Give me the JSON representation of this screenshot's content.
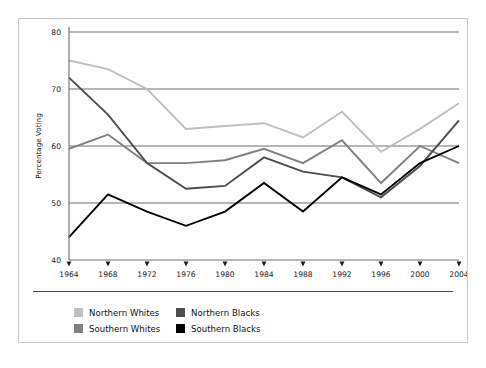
{
  "chart_data": {
    "type": "line",
    "title": "",
    "xlabel": "",
    "ylabel": "Percentage Voting",
    "x": [
      1964,
      1968,
      1972,
      1976,
      1980,
      1984,
      1988,
      1992,
      1996,
      2000,
      2004
    ],
    "xtick_labels": [
      "1964",
      "1968",
      "1972",
      "1976",
      "1980",
      "1984",
      "1988",
      "1992",
      "1996",
      "2000",
      "2004"
    ],
    "ytick_labels": [
      "40",
      "50",
      "60",
      "70",
      "80"
    ],
    "yticks": [
      40,
      50,
      60,
      70,
      80
    ],
    "ylim": [
      40,
      80
    ],
    "xlim": [
      1964,
      2004
    ],
    "grid": "horizontal",
    "legend_position": "below-plot",
    "series": [
      {
        "name": "Northern Whites",
        "color": "#bfbfbf",
        "values": [
          75,
          73.5,
          70,
          63,
          63.5,
          64,
          61.5,
          66,
          59,
          63,
          67.5
        ]
      },
      {
        "name": "Southern Whites",
        "color": "#808080",
        "values": [
          59.5,
          62,
          57,
          57,
          57.5,
          59.5,
          57,
          61,
          53.5,
          60,
          57
        ]
      },
      {
        "name": "Northern Blacks",
        "color": "#4d4d4d",
        "values": [
          72,
          65.5,
          57,
          52.5,
          53,
          58,
          55.5,
          54.5,
          51,
          56.5,
          64.5
        ]
      },
      {
        "name": "Southern Blacks",
        "color": "#000000",
        "values": [
          44,
          51.5,
          48.5,
          46,
          48.5,
          53.5,
          48.5,
          54.5,
          51.5,
          57,
          60
        ]
      }
    ]
  },
  "legend": {
    "columns": [
      [
        "Northern Whites",
        "Southern Whites"
      ],
      [
        "Northern Blacks",
        "Southern Blacks"
      ]
    ]
  },
  "colors": {
    "gridline": "#6e6e6e",
    "axis": "#6e6e6e",
    "frame_border": "#c9c9c9",
    "legend_separator": "#4a4a4a",
    "background": "#ffffff"
  }
}
